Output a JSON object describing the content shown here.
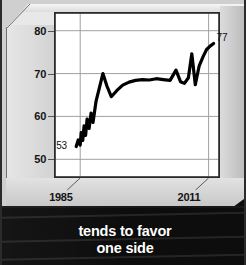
{
  "caption": {
    "line1": "tends to favor",
    "line2": "one side"
  },
  "chart_data": {
    "type": "line",
    "title": "",
    "xlabel": "",
    "ylabel": "",
    "xlim": [
      1980,
      2013
    ],
    "ylim": [
      46,
      84
    ],
    "grid": true,
    "legend": false,
    "y_ticks": [
      "80",
      "70",
      "60",
      "50"
    ],
    "y_tick_values": [
      80,
      70,
      60,
      50
    ],
    "x_ticks": [
      "1985",
      "2011"
    ],
    "x_tick_values": [
      1985,
      2011
    ],
    "annotations": [
      {
        "label": "53",
        "x": 1984,
        "y": 53
      },
      {
        "label": "77",
        "x": 2012,
        "y": 77
      }
    ],
    "series": [
      {
        "name": "trend",
        "color": "#000000",
        "x": [
          1984.2,
          1984.6,
          1985.0,
          1985.2,
          1985.5,
          1985.8,
          1986.1,
          1986.4,
          1986.8,
          1987.2,
          1987.6,
          1988.2,
          1988.9,
          1989.6,
          1990.4,
          1991.3,
          1992.4,
          1993.6,
          1994.9,
          1996.2,
          1997.6,
          1999.0,
          2000.4,
          2001.8,
          2003.2,
          2004.4,
          2005.3,
          2006.1,
          2006.9,
          2007.6,
          2008.3,
          2009.1,
          2009.9,
          2010.6,
          2011.3,
          2012.0
        ],
        "y": [
          53.0,
          54.5,
          53.3,
          56.2,
          54.4,
          57.8,
          55.6,
          59.4,
          57.2,
          60.8,
          58.6,
          63.5,
          66.8,
          70.0,
          67.1,
          64.6,
          66.0,
          67.3,
          68.0,
          68.4,
          68.6,
          68.5,
          68.8,
          68.6,
          68.4,
          70.8,
          68.1,
          67.7,
          69.0,
          74.6,
          67.4,
          71.8,
          74.0,
          75.6,
          76.4,
          77.0
        ]
      }
    ]
  }
}
